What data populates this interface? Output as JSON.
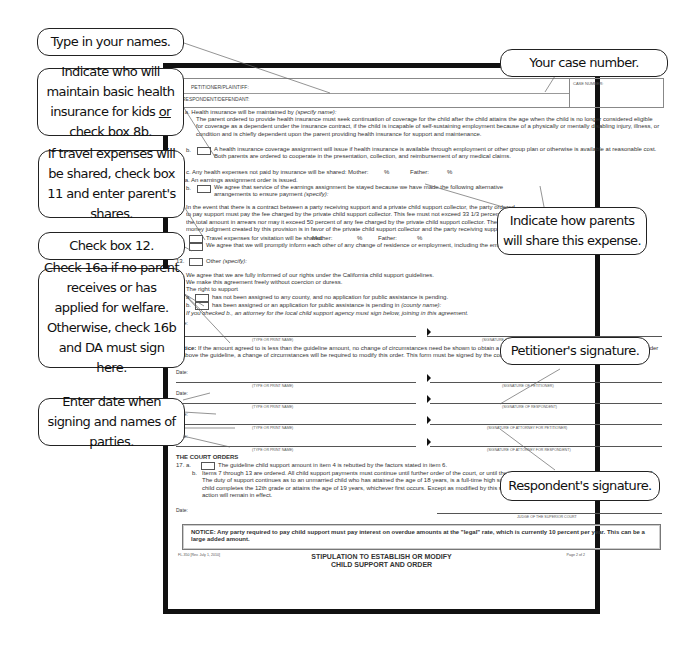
{
  "form": {
    "header": {
      "petitioner_label": "PETITIONER/PLAINTIFF:",
      "respondent_label": "RESPONDENT/DEFENDANT:",
      "case_number_label": "CASE NUMBER:"
    },
    "items": {
      "i8a_num": "8.  a.",
      "i8a": "Health insurance will be maintained by",
      "i8a_hint": "(specify name):",
      "i8a_body": "The parent ordered to provide health insurance must seek continuation of coverage for the child after the child attains the age when the child is no longer considered eligible for coverage as a dependent under the insurance contract, if the child is incapable of self-sustaining employment because of a physically or mentally disabling injury, illness, or condition and is chiefly dependent upon the parent providing health insurance for support and maintenance.",
      "i8b_num": "b.",
      "i8b": "A health insurance coverage assignment will issue if health insurance is available through employment or other group plan or otherwise is available at reasonable cost. Both parents are ordered to cooperate in the presentation, collection, and reimbursement of any medical claims.",
      "i8c": "c.  Any health expenses not paid by insurance will be shared:  Mother:",
      "pct": "%",
      "father": "Father:",
      "i9a": "9.  a.  An earnings assignment order is issued.",
      "i9b_num": "b.",
      "i9b": "We agree that service of the earnings assignment be stayed because we have made the following alternative arrangements to ensure payment",
      "i9b_hint": "(specify):",
      "i10_num": "10.",
      "i10": "In the event that there is a contract between a party receiving support and a private child support collector, the party ordered to pay support must pay the fee charged by the private child support collector. This fee must not exceed 33 1/3 percent of the total amount in arrears nor may it exceed 50 percent of any fee charged by the private child support collector. The money judgment created by this provision is in favor of the private child support collector and the party receiving support.",
      "i11_num": "11.",
      "i11": "Travel expenses for visitation will be shared:",
      "mother": "Mother:",
      "i12_num": "12.",
      "i12": "We agree that we will promptly inform each other of any change of residence or employment, including the employer's name, address, and telephone number.",
      "i13_num": "13.",
      "i13": "Other",
      "i13_hint": "(specify):",
      "i14": "14.  We agree that we are fully informed of our rights under the California child support guidelines.",
      "i15": "15.  We make this agreement freely without coercion or duress.",
      "i16": "16.  The right to support",
      "i16a_num": "a.",
      "i16a": "has not been assigned to any county, and no application for public assistance is pending.",
      "i16b_num": "b.",
      "i16b": "has been assigned or an application for public assistance is pending in",
      "i16b_hint": "(county name):",
      "i16_note": "If you checked b., an attorney for the local child support agency must sign below, joining in this agreement."
    },
    "date_label": "Date:",
    "type_print_name": "(TYPE OR PRINT NAME)",
    "sig_attorney_local": "(SIGNATURE OF ATTORNEY FOR LOCAL CHILD SUPPORT AGENCY)",
    "notice_label": "Notice:",
    "notice_text": "If the amount agreed to is less than the guideline amount, no change of circumstances need be shown to obtain a change in the support order to a higher amount. If the order is above the guideline, a change of circumstances will be required to modify this order. This form must be signed by the court to be effective.",
    "signatures": [
      {
        "date": "Date:",
        "name_label": "(TYPE OR PRINT NAME)",
        "sig_label": "(SIGNATURE OF PETITIONER)"
      },
      {
        "date": "Date:",
        "name_label": "(TYPE OR PRINT NAME)",
        "sig_label": "(SIGNATURE OF RESPONDENT)"
      },
      {
        "date": "Date:",
        "name_label": "(TYPE OR PRINT NAME)",
        "sig_label": "(SIGNATURE OF ATTORNEY FOR PETITIONER)"
      },
      {
        "date": "Date:",
        "name_label": "(TYPE OR PRINT NAME)",
        "sig_label": "(SIGNATURE OF ATTORNEY FOR RESPONDENT)"
      }
    ],
    "court_orders": {
      "title": "THE COURT ORDERS",
      "i17a_num": "17.  a.",
      "i17a": "The guideline child support amount in item 4 is rebutted by the factors stated in item 6.",
      "i17b_num": "b.",
      "i17b": "Items 7 through 13 are ordered. All child support payments must continue until further order of the court, or until the child marries, dies, is emancipated, or reaches age 18. The duty of support continues as to an unmarried child who has attained the age of 18 years, is a full-time high school student, and resides with a parent, until the time the child completes the 12th grade or attains the age of 19 years, whichever first occurs. Except as modified by this stipulation, all provisions of any previous orders made in this action will remain in effect.",
      "date": "Date:",
      "judge_label": "JUDGE OF THE SUPERIOR COURT"
    },
    "bottom_notice": "NOTICE: Any party required to pay child support must pay interest on overdue amounts at the \"legal\" rate, which is currently 10 percent per year. This can be a large added amount.",
    "footer": {
      "form_id": "FL-350 [Rev. July 1, 2010]",
      "title_line1": "STIPULATION TO ESTABLISH OR MODIFY",
      "title_line2": "CHILD SUPPORT AND ORDER",
      "page": "Page 2 of 2"
    }
  },
  "callouts": {
    "names": "Type in your names.",
    "health_pre": "Indicate who will maintain basic health insurance for kids ",
    "health_or": "or",
    "health_post": " check box 8b.",
    "travel": "If travel expenses will be shared, check box 11 and enter parent's shares.",
    "box12": "Check box 12.",
    "welfare": "Check 16a if no parent receives or has applied for welfare.  Otherwise, check 16b and DA must sign here.",
    "date_sign": "Enter date when signing and names of parties.",
    "case_number": "Your case number.",
    "share_expense": "Indicate how parents will share this expense.",
    "petitioner_sig": "Petitioner's signature.",
    "respondent_sig": "Respondent's signature."
  }
}
